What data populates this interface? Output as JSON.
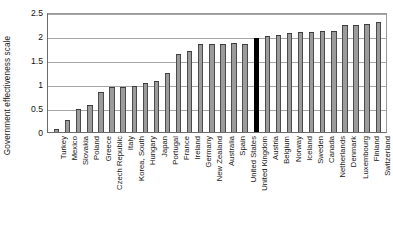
{
  "chart_data": {
    "type": "bar",
    "title": "",
    "xlabel": "",
    "ylabel": "Government effectiveness scale",
    "ylim": [
      0,
      2.5
    ],
    "yticks": [
      0,
      0.5,
      1,
      1.5,
      2,
      2.5
    ],
    "ytick_labels": [
      "0",
      "0.5",
      "1",
      "1.5",
      "2",
      "2.5"
    ],
    "grid": true,
    "legend": "none",
    "highlight_category": "United Kingdom",
    "highlight_color": "#000000",
    "bar_color": "#9b9b9b",
    "categories": [
      "Turkey",
      "Mexico",
      "Slovakia",
      "Poland",
      "Greece",
      "Czech Republic",
      "Italy",
      "Korea, South",
      "Hungary",
      "Japan",
      "Portugal",
      "France",
      "Ireland",
      "Germany",
      "New Zealand",
      "Australia",
      "Spain",
      "United States",
      "United Kingdom",
      "Austria",
      "Belgium",
      "Norway",
      "Iceland",
      "Sweden",
      "Canada",
      "Netherlands",
      "Denmark",
      "Luxembourg",
      "Finland",
      "Switzerland"
    ],
    "values": [
      0.06,
      0.26,
      0.47,
      0.56,
      0.84,
      0.93,
      0.94,
      0.96,
      1.02,
      1.06,
      1.22,
      1.62,
      1.69,
      1.83,
      1.83,
      1.84,
      1.85,
      1.84,
      1.95,
      2.01,
      2.02,
      2.06,
      2.09,
      2.09,
      2.1,
      2.11,
      2.22,
      2.22,
      2.25,
      2.29
    ]
  }
}
